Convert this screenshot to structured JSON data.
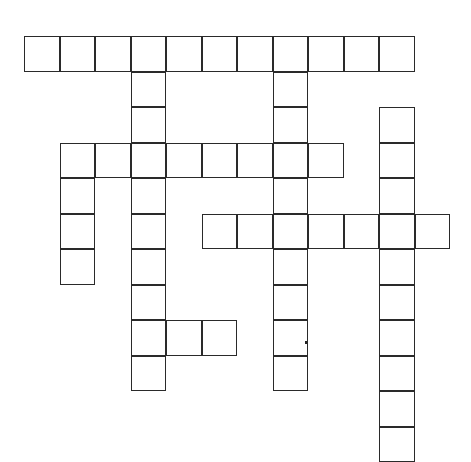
{
  "puzzle": {
    "type": "crossword",
    "cell_size": 35.5,
    "origin": {
      "x": 24,
      "y": 36
    },
    "line_color": "#2a2a2a",
    "background": "#ffffff",
    "words": [
      {
        "id": "across-row0",
        "direction": "across",
        "row": 0,
        "col": 0,
        "length": 11
      },
      {
        "id": "across-row3",
        "direction": "across",
        "row": 3,
        "col": 1,
        "length": 8
      },
      {
        "id": "across-row5",
        "direction": "across",
        "row": 5,
        "col": 5,
        "length": 7
      },
      {
        "id": "across-row8",
        "direction": "across",
        "row": 8,
        "col": 3,
        "length": 3
      },
      {
        "id": "down-col1",
        "direction": "down",
        "row": 3,
        "col": 1,
        "length": 4
      },
      {
        "id": "down-col3",
        "direction": "down",
        "row": 0,
        "col": 3,
        "length": 10
      },
      {
        "id": "down-col7",
        "direction": "down",
        "row": 0,
        "col": 7,
        "length": 10
      },
      {
        "id": "down-col10",
        "direction": "down",
        "row": 2,
        "col": 10,
        "length": 10
      }
    ]
  }
}
